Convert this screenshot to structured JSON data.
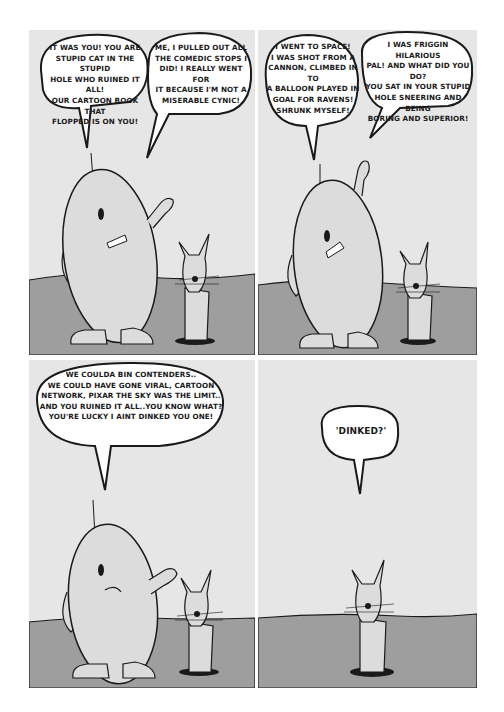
{
  "comic": {
    "layout": "2x2 grid",
    "colors": {
      "sky": "#e6e6e6",
      "ground": "#9e9e9e",
      "character_fill": "#dcdcdc",
      "outline": "#1a1a1a",
      "bubble": "#ffffff"
    },
    "panels": [
      {
        "id": "panel-1",
        "characters": [
          "egg-shaped-figure",
          "cat-in-hole"
        ],
        "bubbles": [
          {
            "speaker": "egg-shaped-figure",
            "text": "It was you! You are\nstupid cat in the stupid\nhole who ruined it all!\nOur cartoon book that\nflopped is on you!"
          },
          {
            "speaker": "egg-shaped-figure",
            "text": "Me, I pulled out all\nthe comedic stops I\ndid! I really went for\nit because I'm not a\nmiserable cynic!"
          }
        ]
      },
      {
        "id": "panel-2",
        "characters": [
          "egg-shaped-figure",
          "cat-in-hole"
        ],
        "bubbles": [
          {
            "speaker": "egg-shaped-figure",
            "text": "I went to space!\nI was shot from a\ncannon, climbed in to\na balloon played in\ngoal for Ravens!\nShrunk myself!"
          },
          {
            "speaker": "egg-shaped-figure",
            "text": "I was friggin hilarious\npal! And what did you do?\nYou sat in your stupid\nhole sneering and being\nboring and superior!"
          }
        ]
      },
      {
        "id": "panel-3",
        "characters": [
          "egg-shaped-figure",
          "cat-in-hole"
        ],
        "bubbles": [
          {
            "speaker": "egg-shaped-figure",
            "text": "We coulda bin contenders..\nWe could have gone viral, Cartoon\nNetwork, Pixar the sky was the limit..\nAnd you ruined it all..you know what?\nYou're lucky I aint dinked you one!"
          }
        ]
      },
      {
        "id": "panel-4",
        "characters": [
          "cat-in-hole"
        ],
        "bubbles": [
          {
            "speaker": "cat-in-hole",
            "text": "'Dinked?'"
          }
        ]
      }
    ]
  }
}
